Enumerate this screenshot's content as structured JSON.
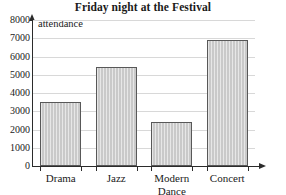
{
  "chart_data": {
    "type": "bar",
    "title": "Friday night at the Festival",
    "xlabel": "",
    "ylabel": "attendance",
    "categories": [
      "Drama",
      "Jazz",
      "Modern\nDance",
      "Concert"
    ],
    "values": [
      3500,
      5400,
      2400,
      6900
    ],
    "ylim": [
      0,
      8000
    ],
    "y_ticks": [
      0,
      1000,
      2000,
      3000,
      4000,
      5000,
      6000,
      7000,
      8000
    ],
    "y_tick_labels": [
      "0",
      "1000",
      "2000",
      "3000",
      "4000",
      "5000",
      "6000",
      "7000",
      "8000"
    ],
    "grid": true,
    "legend": "none",
    "bar_fill_color": "#c9c9c9",
    "bar_border_color": "#585858",
    "gridline_color": "#d8d8d8",
    "axis_color": "#2b2b2b"
  }
}
